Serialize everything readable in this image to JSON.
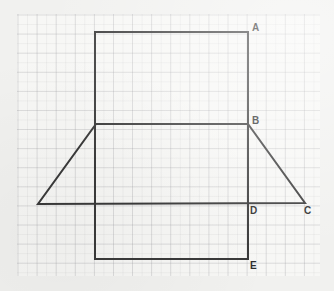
{
  "canvas": {
    "width": 334,
    "height": 291,
    "background": "#f1f1ef"
  },
  "paper": {
    "name": "graph-paper",
    "x": 17,
    "y": 14,
    "width": 303,
    "height": 262,
    "fill": "#f7f7f5",
    "major_grid_px": 19.1,
    "minor_grid_px": 9.55,
    "major_line_color": "#96969b",
    "minor_line_color": "#96969b"
  },
  "figure": {
    "stroke_color": "#3a3a3a",
    "stroke_width": 2,
    "rectangle": {
      "name": "tall-rectangle",
      "points": [
        [
          95,
          32
        ],
        [
          248,
          32
        ],
        [
          248,
          259
        ],
        [
          95,
          259
        ]
      ],
      "top_left": [
        95,
        32
      ],
      "top_right": [
        248,
        32
      ],
      "bottom_right": [
        248,
        259
      ],
      "bottom_left": [
        95,
        259
      ],
      "width_px": 153,
      "height_px": 227
    },
    "trapezoid": {
      "name": "trapezoid",
      "points": [
        [
          96,
          124
        ],
        [
          248,
          124
        ],
        [
          305,
          203
        ],
        [
          38,
          204
        ]
      ],
      "top_left": [
        96,
        124
      ],
      "top_right": [
        248,
        124
      ],
      "bottom_right": [
        305,
        203
      ],
      "bottom_left": [
        38,
        204
      ],
      "top_width_px": 152,
      "bottom_width_px": 267,
      "height_px": 80
    }
  },
  "labels": [
    {
      "id": "A",
      "text": "A",
      "vertex": [
        248,
        32
      ],
      "x": 252,
      "y": 23,
      "desc": "top-right-corner-of-rectangle"
    },
    {
      "id": "B",
      "text": "B",
      "vertex": [
        248,
        124
      ],
      "x": 252,
      "y": 116,
      "desc": "top-right-corner-of-trapezoid"
    },
    {
      "id": "C",
      "text": "C",
      "vertex": [
        305,
        203
      ],
      "x": 304,
      "y": 206,
      "desc": "bottom-right-corner-of-trapezoid"
    },
    {
      "id": "D",
      "text": "D",
      "vertex": [
        248,
        203
      ],
      "x": 250,
      "y": 206,
      "desc": "intersection-right-side-and-trapezoid-base"
    },
    {
      "id": "E",
      "text": "E",
      "vertex": [
        248,
        259
      ],
      "x": 250,
      "y": 261,
      "desc": "bottom-right-corner-of-rectangle"
    }
  ]
}
